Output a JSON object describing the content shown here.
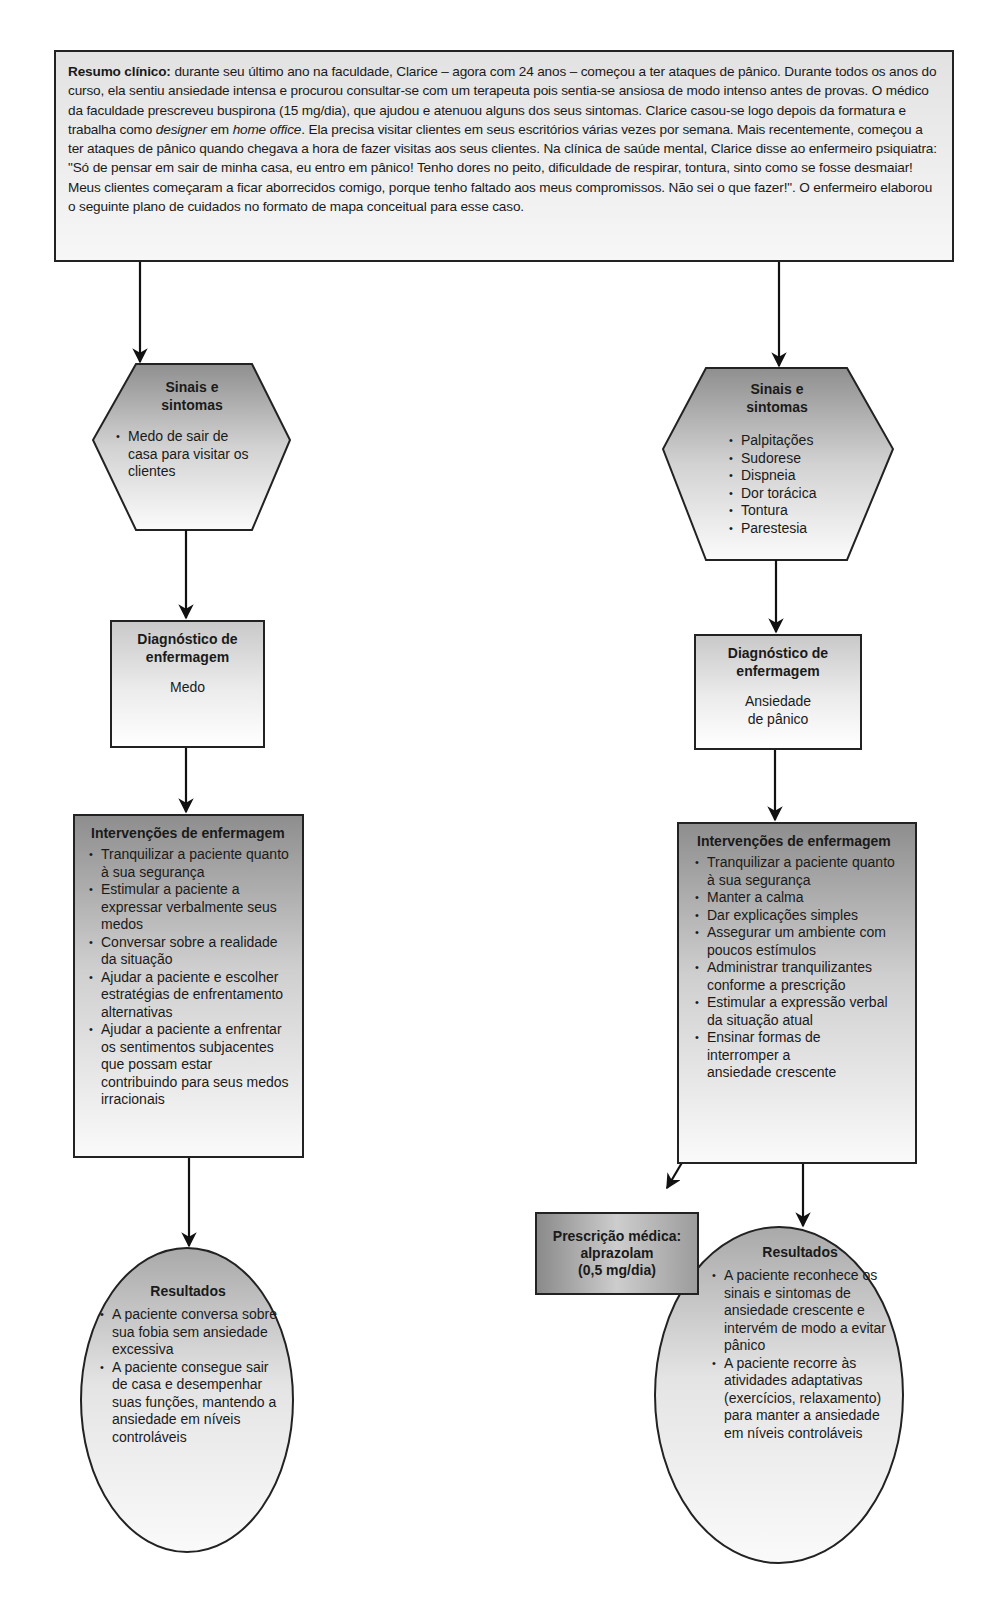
{
  "summary": {
    "label": "Resumo clínico:",
    "text_part1": " durante seu último ano na faculdade, Clarice – agora com 24 anos – começou a ter ataques de pânico. Durante todos os anos do curso, ela sentiu ansiedade intensa e procurou consultar-se com um terapeuta pois sentia-se ansiosa de modo intenso antes de provas. O médico da faculdade prescreveu buspirona (15 mg/dia), que ajudou e atenuou alguns dos seus sintomas. Clarice casou-se logo depois da formatura e trabalha como ",
    "italic1": "designer",
    "text_part2": " em ",
    "italic2": "home office",
    "text_part3": ". Ela precisa visitar clientes em seus escritórios várias vezes por semana. Mais recentemente, começou a ter ataques de pânico quando chegava a hora de fazer visitas aos seus clientes. Na clínica de saúde mental, Clarice disse ao enfermeiro psiquiatra: \"Só de pensar em sair de minha casa, eu entro em pânico! Tenho dores no peito, dificuldade de respirar, tontura, sinto como se fosse desmaiar! Meus clientes começaram a ficar aborrecidos comigo, porque tenho faltado aos meus compromissos. Não sei o que fazer!\". O enfermeiro elaborou o seguinte plano de cuidados no formato de mapa conceitual para esse caso."
  },
  "left": {
    "signs": {
      "title_line1": "Sinais e",
      "title_line2": "sintomas",
      "items": [
        "Medo de sair de casa para visitar os clientes"
      ]
    },
    "diagnosis": {
      "title_line1": "Diagnóstico de",
      "title_line2": "enfermagem",
      "value": "Medo"
    },
    "interventions": {
      "title": "Intervenções de enfermagem",
      "items": [
        "Tranquilizar a paciente quanto à sua segurança",
        "Estimular a paciente a expressar verbalmente seus medos",
        "Conversar sobre a realidade da situação",
        "Ajudar a paciente e escolher estratégias de enfrentamento alternativas",
        "Ajudar a paciente a enfrentar os sentimentos subjacentes que possam estar contribuindo para seus medos irracionais"
      ]
    },
    "results": {
      "title": "Resultados",
      "items": [
        "A paciente conversa sobre sua fobia sem ansiedade excessiva",
        "A paciente consegue sair de casa e desempenhar suas funções, mantendo a ansiedade em níveis controláveis"
      ]
    }
  },
  "right": {
    "signs": {
      "title_line1": "Sinais e",
      "title_line2": "sintomas",
      "items": [
        "Palpitações",
        "Sudorese",
        "Dispneia",
        "Dor torácica",
        "Tontura",
        "Parestesia"
      ]
    },
    "diagnosis": {
      "title_line1": "Diagnóstico de",
      "title_line2": "enfermagem",
      "value_line1": "Ansiedade",
      "value_line2": "de pânico"
    },
    "interventions": {
      "title": "Intervenções de enfermagem",
      "items": [
        "Tranquilizar a paciente quanto à sua segurança",
        "Manter a calma",
        "Dar explicações simples",
        "Assegurar um ambiente com poucos estímulos",
        "Administrar tranquilizantes conforme a prescrição",
        "Estimular a expressão verbal da situação atual",
        "Ensinar formas de interromper a ansiedade crescente"
      ]
    },
    "prescription": {
      "line1": "Prescrição médica:",
      "line2": "alprazolam",
      "line3": "(0,5 mg/dia)"
    },
    "results": {
      "title": "Resultados",
      "items": [
        "A paciente reconhece os sinais e sintomas de ansiedade crescente e intervém de modo a evitar pânico",
        "A paciente recorre às atividades adaptativas (exercícios, relaxamento) para manter a ansiedade em níveis controláveis"
      ]
    }
  },
  "colors": {
    "stroke": "#222222",
    "background": "#ffffff"
  }
}
